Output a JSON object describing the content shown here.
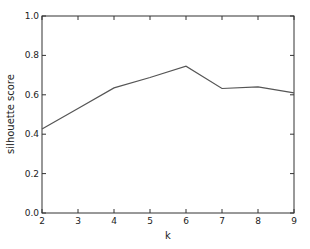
{
  "chart_data": {
    "type": "line",
    "title": "",
    "xlabel": "k",
    "ylabel": "silhouette score",
    "x": [
      2,
      3,
      4,
      5,
      6,
      7,
      8,
      9
    ],
    "series": [
      {
        "name": "silhouette score",
        "values": [
          0.426,
          0.53,
          0.635,
          0.688,
          0.745,
          0.632,
          0.64,
          0.61
        ],
        "color": "#555555"
      }
    ],
    "xlim": [
      2,
      9
    ],
    "ylim": [
      0.0,
      1.0
    ],
    "xticks": [
      "2",
      "3",
      "4",
      "5",
      "6",
      "7",
      "8",
      "9"
    ],
    "yticks": [
      "0.0",
      "0.2",
      "0.4",
      "0.6",
      "0.8",
      "1.0"
    ],
    "grid": false,
    "legend": null
  }
}
